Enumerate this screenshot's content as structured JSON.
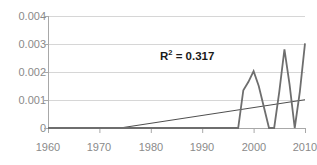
{
  "chart_data": {
    "type": "line",
    "title": "",
    "title_clipped": true,
    "xlabel": "",
    "ylabel": "",
    "xlim": [
      1960,
      2010
    ],
    "ylim": [
      0,
      0.004
    ],
    "grid": true,
    "gridlines_axis": "y",
    "legend": false,
    "y_ticks": [
      "0",
      "0.001",
      "0.002",
      "0.003",
      "0.004"
    ],
    "y_tick_values": [
      0,
      0.001,
      0.002,
      0.003,
      0.004
    ],
    "x_ticks": [
      "1960",
      "1970",
      "1980",
      "1990",
      "2000",
      "2010"
    ],
    "x_tick_values": [
      1960,
      1970,
      1980,
      1990,
      2000,
      2010
    ],
    "annotations": [
      {
        "name": "r-squared",
        "base": "R",
        "exponent": "2",
        "rest": " = 0.317",
        "text": "R2 = 0.317",
        "value": 0.317
      }
    ],
    "series": [
      {
        "name": "data",
        "color": "#6e6e6e",
        "width": 1.8,
        "x": [
          1960,
          1997,
          1998,
          1999,
          2000,
          2001,
          2002,
          2003,
          2004,
          2005,
          2006,
          2007,
          2008,
          2009,
          2010
        ],
        "values": [
          0,
          0,
          0.00135,
          0.00165,
          0.00203,
          0.0015,
          0.00075,
          0,
          0,
          0.0013,
          0.00281,
          0.00155,
          0,
          0.0013,
          0.00302
        ]
      },
      {
        "name": "linear-trendline",
        "color": "#3a3a3a",
        "width": 0.9,
        "x": [
          1960,
          1974,
          2010
        ],
        "values": [
          0,
          0,
          0.00101
        ]
      }
    ]
  },
  "axes": {
    "axis_color": "#a8a8a8",
    "grid_color": "#d6d6d6",
    "tick_label_color": "#8a8a8a",
    "plot_left_px": 48,
    "plot_right_px": 305,
    "plot_top_px": 16,
    "plot_bottom_px": 128
  },
  "colors": {
    "background": "#ffffff",
    "series": "#6e6e6e",
    "trendline": "#3a3a3a",
    "grid": "#d6d6d6",
    "axis": "#a8a8a8",
    "annotation_text": "#1a1a1a",
    "tick_text": "#8a8a8a"
  }
}
